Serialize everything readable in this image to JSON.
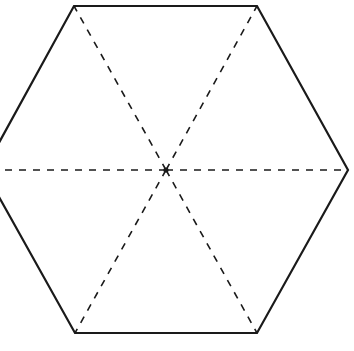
{
  "diagram": {
    "shape": "regular-hexagon",
    "center": {
      "x": 166,
      "y": 170
    },
    "vertices": [
      {
        "x": 74,
        "y": 6
      },
      {
        "x": 257,
        "y": 6
      },
      {
        "x": 348,
        "y": 170
      },
      {
        "x": 257,
        "y": 333
      },
      {
        "x": 75,
        "y": 333
      },
      {
        "x": -16,
        "y": 170
      }
    ],
    "outline_color": "#1a1a1a",
    "dash_color": "#1a1a1a",
    "center_marker": "dot"
  }
}
